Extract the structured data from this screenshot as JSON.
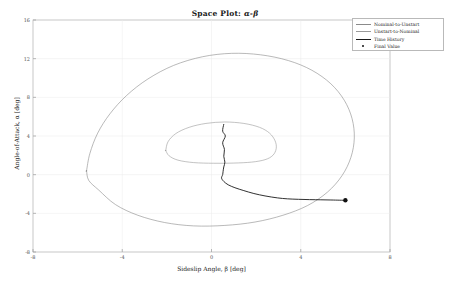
{
  "chart_data": {
    "type": "line",
    "title": "Space Plot: α-β",
    "title_prefix": "Space Plot:",
    "title_symbols": "α-β",
    "xlabel": "Sideslip Angle, β [deg]",
    "ylabel": "Angle-of-Attack, α [deg]",
    "xlim": [
      -8,
      8
    ],
    "ylim": [
      -8,
      16
    ],
    "xticks": [
      -8,
      -4,
      0,
      4,
      8
    ],
    "xticklabels": [
      "-8",
      "-4",
      "0",
      "4",
      "8"
    ],
    "yticks": [
      -8,
      -4,
      0,
      4,
      8,
      12,
      16
    ],
    "yticklabels": [
      "-8",
      "-4",
      "0",
      "4",
      "8",
      "12",
      "16"
    ],
    "grid": true,
    "legend_position": "upper right",
    "series": [
      {
        "name": "Nominal-to-Unstart",
        "color": "#8a8a8a",
        "width": 0.6,
        "style": "solid",
        "description": "Large outer closed boundary curve enclosing the nominal operating envelope",
        "points": [
          [
            -5.6,
            0.4
          ],
          [
            -5.45,
            2.2
          ],
          [
            -5.1,
            4.3
          ],
          [
            -4.55,
            6.3
          ],
          [
            -3.8,
            8.2
          ],
          [
            -2.85,
            9.9
          ],
          [
            -1.7,
            11.3
          ],
          [
            -0.4,
            12.2
          ],
          [
            0.9,
            12.55
          ],
          [
            2.2,
            12.4
          ],
          [
            3.45,
            11.8
          ],
          [
            4.5,
            10.8
          ],
          [
            5.35,
            9.4
          ],
          [
            5.95,
            7.7
          ],
          [
            6.3,
            5.8
          ],
          [
            6.4,
            3.8
          ],
          [
            6.25,
            1.8
          ],
          [
            5.85,
            -0.1
          ],
          [
            5.2,
            -1.8
          ],
          [
            4.3,
            -3.2
          ],
          [
            3.2,
            -4.2
          ],
          [
            1.95,
            -4.9
          ],
          [
            0.6,
            -5.25
          ],
          [
            -0.8,
            -5.3
          ],
          [
            -2.1,
            -4.95
          ],
          [
            -3.3,
            -4.2
          ],
          [
            -4.3,
            -3.1
          ],
          [
            -5.05,
            -1.6
          ],
          [
            -5.5,
            -0.6
          ],
          [
            -5.6,
            0.4
          ]
        ]
      },
      {
        "name": "Unstart-to-Nominal",
        "color": "#9a9a9a",
        "width": 0.6,
        "style": "solid",
        "description": "Smaller inner closed boundary curve around the origin region",
        "points": [
          [
            -2.05,
            2.5
          ],
          [
            -1.95,
            3.4
          ],
          [
            -1.6,
            4.25
          ],
          [
            -1.0,
            4.9
          ],
          [
            -0.25,
            5.3
          ],
          [
            0.6,
            5.45
          ],
          [
            1.45,
            5.3
          ],
          [
            2.15,
            4.9
          ],
          [
            2.6,
            4.3
          ],
          [
            2.85,
            3.5
          ],
          [
            2.9,
            2.7
          ],
          [
            2.75,
            2.0
          ],
          [
            2.4,
            1.55
          ],
          [
            1.8,
            1.3
          ],
          [
            1.0,
            1.2
          ],
          [
            0.1,
            1.18
          ],
          [
            -0.8,
            1.25
          ],
          [
            -1.5,
            1.5
          ],
          [
            -1.9,
            1.95
          ],
          [
            -2.05,
            2.5
          ]
        ]
      },
      {
        "name": "Time History",
        "color": "#1a1a1a",
        "width": 0.9,
        "style": "solid",
        "description": "Dark trajectory descending from the inner region then running right along the lower boundary",
        "points": [
          [
            0.55,
            5.2
          ],
          [
            0.5,
            4.5
          ],
          [
            0.62,
            4.0
          ],
          [
            0.5,
            3.3
          ],
          [
            0.58,
            2.6
          ],
          [
            0.55,
            1.9
          ],
          [
            0.6,
            1.3
          ],
          [
            0.55,
            0.8
          ],
          [
            0.52,
            0.35
          ],
          [
            0.5,
            0.0
          ],
          [
            0.45,
            -0.35
          ],
          [
            0.55,
            -0.7
          ],
          [
            0.75,
            -1.05
          ],
          [
            1.05,
            -1.35
          ],
          [
            1.45,
            -1.65
          ],
          [
            1.9,
            -1.95
          ],
          [
            2.4,
            -2.2
          ],
          [
            2.95,
            -2.4
          ],
          [
            3.4,
            -2.5
          ],
          [
            3.9,
            -2.55
          ],
          [
            4.4,
            -2.58
          ],
          [
            4.9,
            -2.6
          ],
          [
            5.35,
            -2.62
          ],
          [
            5.75,
            -2.64
          ],
          [
            6.0,
            -2.65
          ]
        ]
      }
    ],
    "markers": [
      {
        "name": "Final Value",
        "color": "#111111",
        "marker": "dot",
        "size": 2.2,
        "point": [
          6.0,
          -2.65
        ]
      }
    ],
    "legend_entries": [
      {
        "label": "Nominal-to-Unstart",
        "type": "line",
        "color": "#8a8a8a",
        "width": 0.6
      },
      {
        "label": "Unstart-to-Nominal",
        "type": "line",
        "color": "#9a9a9a",
        "width": 0.6
      },
      {
        "label": "Time History",
        "type": "line",
        "color": "#1a1a1a",
        "width": 0.9
      },
      {
        "label": "Final Value",
        "type": "marker",
        "color": "#111111",
        "width": 0
      }
    ]
  }
}
